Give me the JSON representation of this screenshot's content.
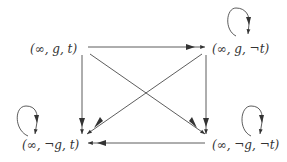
{
  "diagram": {
    "type": "state-transition-graph",
    "nodes": [
      {
        "id": "n1",
        "label": "(∞, g, t)",
        "self_loop": false
      },
      {
        "id": "n2",
        "label": "(∞, g, ¬t)",
        "self_loop": true
      },
      {
        "id": "n3",
        "label": "(∞, ¬g, t)",
        "self_loop": true
      },
      {
        "id": "n4",
        "label": "(∞, ¬g, ¬t)",
        "self_loop": true
      }
    ],
    "edges": [
      {
        "from": "n1",
        "to": "n2"
      },
      {
        "from": "n1",
        "to": "n3"
      },
      {
        "from": "n1",
        "to": "n4"
      },
      {
        "from": "n2",
        "to": "n3"
      },
      {
        "from": "n2",
        "to": "n4"
      },
      {
        "from": "n4",
        "to": "n3"
      },
      {
        "from": "n2",
        "to": "n2"
      },
      {
        "from": "n3",
        "to": "n3"
      },
      {
        "from": "n4",
        "to": "n4"
      }
    ],
    "colors": {
      "line": "#333333",
      "background": "#ffffff"
    }
  }
}
